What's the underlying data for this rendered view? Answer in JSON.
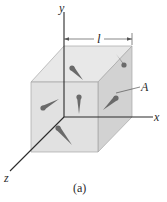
{
  "figure": {
    "caption": "(a)",
    "axes": {
      "x": "x",
      "y": "y",
      "z": "z"
    },
    "dimension_label": "l",
    "surface_label": "A",
    "colors": {
      "cube_front": "#dedede",
      "cube_top": "#e8e8e8",
      "cube_side": "#cfcfcf",
      "edge": "#9a9a9a",
      "axis": "#2a2a2a",
      "molecule": "#6a6a6a"
    }
  }
}
